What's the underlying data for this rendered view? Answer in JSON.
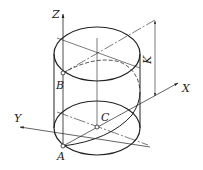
{
  "figure": {
    "type": "isometric cylinder with helix and coordinate axes",
    "labels": {
      "z_axis": "Z",
      "x_axis": "X",
      "y_axis": "Y",
      "point_a": "A",
      "point_b": "B",
      "point_c": "C",
      "dimension": "K"
    },
    "colors": {
      "stroke": "#222222",
      "background": "#ffffff"
    }
  }
}
